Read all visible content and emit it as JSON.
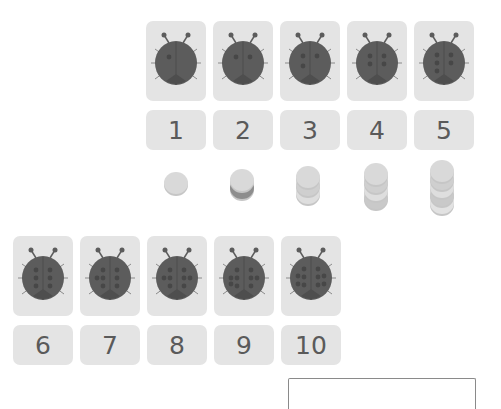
{
  "cards": [
    {
      "number": "1",
      "spots": 1
    },
    {
      "number": "2",
      "spots": 2
    },
    {
      "number": "3",
      "spots": 3
    },
    {
      "number": "4",
      "spots": 4
    },
    {
      "number": "5",
      "spots": 5
    },
    {
      "number": "6",
      "spots": 6
    },
    {
      "number": "7",
      "spots": 7
    },
    {
      "number": "8",
      "spots": 8
    },
    {
      "number": "9",
      "spots": 9
    },
    {
      "number": "10",
      "spots": 10
    }
  ],
  "counter_stacks": [
    1,
    2,
    3,
    4,
    5
  ],
  "colors": {
    "card_bg": "#e4e4e4",
    "ladybug_body": "#5c5c5c",
    "number_text": "#5a5a5a",
    "counter": "#d8d8d8"
  },
  "icons": {
    "ladybug": "ladybug-icon",
    "counter": "counter-disc-icon"
  }
}
